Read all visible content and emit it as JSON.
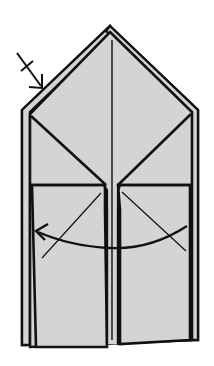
{
  "diagram": {
    "type": "origami-step",
    "colors": {
      "paper": "#d4d4d4",
      "line": "#111111",
      "background": "#ffffff"
    },
    "symbols": [
      {
        "name": "valley-fold-arrow",
        "location": "upper-left",
        "meaning": "fold/push in"
      },
      {
        "name": "curved-fold-arrow",
        "location": "lower-middle",
        "direction": "right-to-left"
      }
    ]
  }
}
